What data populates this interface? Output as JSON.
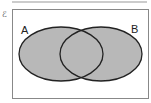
{
  "diagram": {
    "type": "venn",
    "universal_set_symbol": "ℰ",
    "sets": [
      {
        "label": "A"
      },
      {
        "label": "B"
      }
    ],
    "shaded_region": "A ∪ B",
    "colors": {
      "shade": "#b8b8b8",
      "stroke": "#222222",
      "frame": "#888888"
    }
  }
}
